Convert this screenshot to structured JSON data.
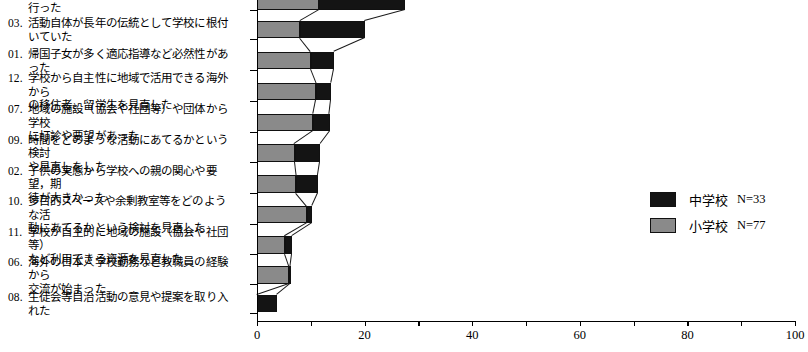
{
  "chart_data": {
    "type": "bar",
    "orientation": "horizontal",
    "stacked": true,
    "title": "",
    "xlabel": "",
    "ylabel": "",
    "xlim": [
      0,
      100
    ],
    "xticks": [
      0,
      10,
      20,
      30,
      40,
      50,
      60,
      70,
      80,
      90,
      100
    ],
    "xticklabels": [
      "0",
      "",
      "20",
      "",
      "40",
      "",
      "60",
      "",
      "80",
      "",
      "100"
    ],
    "grid": false,
    "legend_position": "right",
    "colors": {
      "chugakko": "#141414",
      "shogakko": "#8a8a8a"
    },
    "series": [
      {
        "name": "小学校",
        "n_label": "N=77",
        "color": "#8a8a8a",
        "values": [
          11.5,
          8.0,
          10.0,
          11.0,
          10.5,
          7.0,
          7.3,
          9.3,
          5.2,
          6.0,
          0.0
        ]
      },
      {
        "name": "中学校",
        "n_label": "N=33",
        "color": "#141414",
        "values": [
          16.0,
          12.0,
          4.3,
          2.8,
          3.0,
          4.7,
          4.0,
          0.9,
          1.3,
          0.2,
          3.7
        ]
      }
    ],
    "categories": [
      {
        "num": "05.",
        "label": "都市部の行事と行政の政策の一環として行った",
        "clipped": true
      },
      {
        "num": "03.",
        "label": "活動自体が長年の伝統として学校に根付いていた"
      },
      {
        "num": "01.",
        "label": "帰国子女が多く適応指導など必然性があった"
      },
      {
        "num": "12.",
        "label": "学校から自主性に地域で活用できる海外から\nの移住者、留学生を見直した"
      },
      {
        "num": "07.",
        "label": "地域の施設（協会や社団等）や団体から学校\nに打診や要望があった"
      },
      {
        "num": "09.",
        "label": "時間をどのような活動にあてるかという検討\nや見直しをした"
      },
      {
        "num": "02.",
        "label": "子供の実態から学校への親の関心や要望，期\n待が大きかった"
      },
      {
        "num": "10.",
        "label": "多目的スペースや余剰教室等をどのような活\n動にあてるかという検討を見直した"
      },
      {
        "num": "11.",
        "label": "学校が自主的に地域の施設（協会や社団等）\nなど利用できる資源を見直した"
      },
      {
        "num": "06.",
        "label": "海外の日本人学校勤務など教職員の経験から\n交流が始まった"
      },
      {
        "num": "08.",
        "label": "生徒会等自治活動の意見や提案を取り入れた"
      }
    ]
  }
}
